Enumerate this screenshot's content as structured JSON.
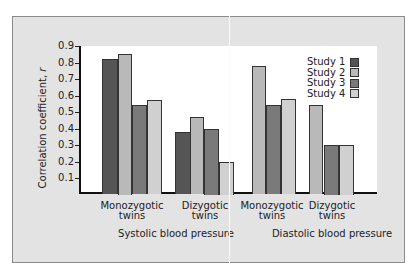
{
  "chart_data": {
    "type": "bar",
    "title": "",
    "xlabel": "",
    "ylabel": "Correlation coefficient, r",
    "ylim": [
      0,
      0.9
    ],
    "yticks": [
      "0.1",
      "0.2",
      "0.3",
      "0.4",
      "0.5",
      "0.6",
      "0.7",
      "0.8",
      "0.9"
    ],
    "grid": false,
    "legend_position": "upper right",
    "groups": [
      "Systolic blood pressure",
      "Diastolic blood pressure"
    ],
    "categories": [
      "Systolic - Monozygotic twins",
      "Systolic - Dizygotic twins",
      "Diastolic - Monozygotic twins",
      "Diastolic - Dizygotic twins"
    ],
    "series": [
      {
        "name": "Study 1",
        "color": "#555555",
        "values": [
          0.82,
          0.38,
          null,
          null
        ]
      },
      {
        "name": "Study 2",
        "color": "#b9b9b9",
        "values": [
          0.85,
          0.47,
          0.78,
          0.54
        ]
      },
      {
        "name": "Study 3",
        "color": "#7a7a7a",
        "values": [
          0.54,
          0.4,
          0.54,
          0.3
        ]
      },
      {
        "name": "Study 4",
        "color": "#d0d0d0",
        "values": [
          0.57,
          0.2,
          0.58,
          0.3
        ]
      }
    ]
  },
  "axis": {
    "ylabel_main": "Correlation coefficient, ",
    "ylabel_var": "r",
    "ticks": [
      "0.1",
      "0.2",
      "0.3",
      "0.4",
      "0.5",
      "0.6",
      "0.7",
      "0.8",
      "0.9"
    ]
  },
  "legend": [
    "Study 1",
    "Study 2",
    "Study 3",
    "Study 4"
  ],
  "xaxis": {
    "cat_line1": [
      "Monozygotic",
      "Dizygotic",
      "Monozygotic",
      "Dizygotic"
    ],
    "cat_line2": [
      "twins",
      "twins",
      "twins",
      "twins"
    ],
    "groups": [
      "Systolic blood pressure",
      "Diastolic blood pressure"
    ]
  }
}
